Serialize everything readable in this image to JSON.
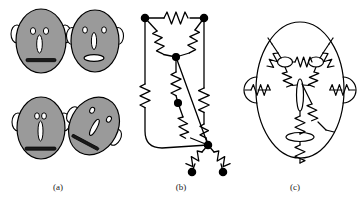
{
  "figure": {
    "type": "scientific-figure",
    "panel_count": 3,
    "background_color": "#ffffff"
  },
  "captions": {
    "a": "(a)",
    "b": "(b)",
    "c": "(c)"
  },
  "colors": {
    "face_fill": "#9a9a9a",
    "stroke": "#000000",
    "feature_fill": "#ffffff",
    "mouth_fill": "#1a1a1a",
    "caption_text": "#1a1a1a"
  },
  "panel_a": {
    "name": "cartoon-faces",
    "description": "Four shaded cartoon faces with eyes, nose, mouth and ears",
    "faces": [
      {
        "id": "face-1",
        "label": "upper-left-face",
        "cx": 41,
        "cy": 41,
        "rx": 25,
        "ry": 32,
        "rotation": 0,
        "eyes": [
          {
            "cx": 33,
            "cy": 31,
            "rx": 2.6,
            "ry": 3.4
          },
          {
            "cx": 46,
            "cy": 31,
            "rx": 2.6,
            "ry": 3.4
          }
        ],
        "nose": {
          "cx": 39.5,
          "cy": 44,
          "rx": 2.8,
          "ry": 9
        },
        "mouth": {
          "x": 26,
          "y": 59,
          "w": 30,
          "h": 3.2,
          "style": "line"
        },
        "ears": [
          {
            "cx": 17,
            "cy": 34,
            "rx": 6,
            "ry": 9,
            "side": "left"
          },
          {
            "cx": 65,
            "cy": 34,
            "rx": 6,
            "ry": 9,
            "side": "right"
          }
        ]
      },
      {
        "id": "face-2",
        "label": "upper-right-face",
        "cx": 95,
        "cy": 41,
        "rx": 24,
        "ry": 31,
        "rotation": 0,
        "eyes": [
          {
            "cx": 85,
            "cy": 30,
            "rx": 2.4,
            "ry": 3.2
          },
          {
            "cx": 104,
            "cy": 30,
            "rx": 2.4,
            "ry": 3.2
          }
        ],
        "nose": {
          "cx": 94,
          "cy": 41,
          "rx": 2.6,
          "ry": 8.5
        },
        "mouth": {
          "cx": 94,
          "cy": 58,
          "rx": 10,
          "ry": 3.4,
          "style": "oval"
        },
        "ears": [
          {
            "cx": 72,
            "cy": 36,
            "rx": 5.5,
            "ry": 8.5,
            "side": "left"
          },
          {
            "cx": 118,
            "cy": 36,
            "rx": 5.5,
            "ry": 8.5,
            "side": "right"
          }
        ]
      },
      {
        "id": "face-3",
        "label": "lower-left-face",
        "cx": 41,
        "cy": 128,
        "rx": 24,
        "ry": 31,
        "rotation": 0,
        "eyes": [
          {
            "cx": 37,
            "cy": 116,
            "rx": 2.4,
            "ry": 3.2
          },
          {
            "cx": 44,
            "cy": 116,
            "rx": 2.4,
            "ry": 3.2
          }
        ],
        "nose": {
          "cx": 40.5,
          "cy": 131,
          "rx": 2.5,
          "ry": 10
        },
        "mouth": {
          "x": 25,
          "y": 147,
          "w": 31,
          "h": 3.2,
          "style": "line"
        },
        "ears": [
          {
            "cx": 18,
            "cy": 122,
            "rx": 6,
            "ry": 9,
            "side": "left"
          },
          {
            "cx": 64,
            "cy": 122,
            "rx": 6,
            "ry": 9,
            "side": "right"
          }
        ]
      },
      {
        "id": "face-4",
        "label": "lower-right-face-rotated",
        "cx": 94,
        "cy": 126,
        "rx": 24,
        "ry": 30,
        "rotation": 30,
        "eyes": [
          {
            "cx": 89,
            "cy": 107,
            "rx": 2.2,
            "ry": 3.0
          },
          {
            "cx": 112,
            "cy": 128,
            "rx": 2.2,
            "ry": 3.0
          }
        ],
        "nose": {
          "cx": 101,
          "cy": 129,
          "rx": 2.6,
          "ry": 9
        },
        "mouth": {
          "x": 78,
          "y": 148,
          "w": 27,
          "h": 3.0,
          "style": "line"
        },
        "ears": [
          {
            "cx": 77,
            "cy": 153,
            "rx": 5.5,
            "ry": 8.5,
            "side": "bottom-left"
          },
          {
            "cx": 115,
            "cy": 152,
            "rx": 5.5,
            "ry": 8.5,
            "side": "bottom-right"
          }
        ]
      }
    ]
  },
  "panel_b": {
    "name": "resistor-network-graph",
    "description": "Abstract graph of nodes joined by zig-zag resistor edges",
    "node_radius": 3.4,
    "nodes": [
      {
        "id": "n1",
        "label": "top-left-node",
        "x": 19,
        "y": 18
      },
      {
        "id": "n2",
        "label": "top-right-node",
        "x": 78,
        "y": 18
      },
      {
        "id": "n3",
        "label": "upper-center-node",
        "x": 50,
        "y": 57
      },
      {
        "id": "n4",
        "label": "mid-center-node",
        "x": 52,
        "y": 103
      },
      {
        "id": "n5",
        "label": "bottom-junction-node",
        "x": 82,
        "y": 145
      },
      {
        "id": "n6",
        "label": "bottom-left-terminal",
        "x": 66,
        "y": 172
      },
      {
        "id": "n7",
        "label": "bottom-right-terminal",
        "x": 97,
        "y": 172
      }
    ],
    "resistor_edges": [
      {
        "from": "n1",
        "to": "n2",
        "label": "top-horizontal-resistor"
      },
      {
        "from": "n1",
        "to": "n3",
        "label": "left-diagonal-resistor"
      },
      {
        "from": "n2",
        "to": "n3",
        "label": "right-diagonal-resistor"
      },
      {
        "from": "n3",
        "to": "n4",
        "label": "center-vertical-resistor"
      },
      {
        "from": "n4",
        "to": "n5",
        "label": "center-lower-resistor"
      },
      {
        "from": "n2",
        "to": "n5",
        "label": "right-vertical-resistor"
      },
      {
        "from": "n1",
        "to": "n5",
        "label": "left-outer-resistor-loop"
      },
      {
        "from": "n5",
        "to": "n6",
        "label": "bottom-left-resistor"
      },
      {
        "from": "n5",
        "to": "n7",
        "label": "bottom-right-resistor"
      }
    ],
    "plain_edges": [
      {
        "from": "n3",
        "to": "n5",
        "label": "plain-wire-center-to-junction"
      }
    ]
  },
  "panel_c": {
    "name": "face-shaped-circuit",
    "description": "Circuit diagram laid out in the shape of a face: ellipse outline, two eye loops, nose loop, mouth loop and two ear loops, all connected by resistors",
    "outline": {
      "cx": 62,
      "cy": 90,
      "rx": 44,
      "ry": 68,
      "label": "face-outline-ellipse"
    },
    "eyes": [
      {
        "cx": 47,
        "cy": 62,
        "rx": 7.5,
        "ry": 5,
        "label": "left-eye-loop"
      },
      {
        "cx": 78,
        "cy": 62,
        "rx": 7.5,
        "ry": 5,
        "label": "right-eye-loop"
      }
    ],
    "nose": {
      "cx": 62,
      "cy": 95,
      "rx": 3.5,
      "ry": 16,
      "label": "nose-loop"
    },
    "mouth": {
      "cx": 62,
      "cy": 137,
      "rx": 14,
      "ry": 4.5,
      "label": "mouth-loop"
    },
    "ears": [
      {
        "cx": 14,
        "cy": 90,
        "r": 12,
        "side": "left",
        "label": "left-ear-loop"
      },
      {
        "cx": 110,
        "cy": 90,
        "r": 12,
        "side": "right",
        "label": "right-ear-loop"
      }
    ],
    "resistors": [
      {
        "label": "eye-bridge-resistor",
        "orientation": "horizontal",
        "between": [
          "left-eye-loop",
          "right-eye-loop"
        ]
      },
      {
        "label": "left-eye-to-brow-resistor",
        "orientation": "diagonal",
        "between": [
          "left-eye-loop",
          "face-outline-ellipse"
        ]
      },
      {
        "label": "right-eye-to-brow-resistor",
        "orientation": "diagonal",
        "between": [
          "right-eye-loop",
          "face-outline-ellipse"
        ]
      },
      {
        "label": "left-eye-to-nose-resistor",
        "orientation": "diagonal",
        "between": [
          "left-eye-loop",
          "nose-loop"
        ]
      },
      {
        "label": "right-eye-to-nose-resistor",
        "orientation": "diagonal",
        "between": [
          "right-eye-loop",
          "nose-loop"
        ]
      },
      {
        "label": "nose-to-mouth-resistor",
        "orientation": "vertical",
        "between": [
          "nose-loop",
          "mouth-loop"
        ]
      },
      {
        "label": "cheek-resistor",
        "orientation": "diagonal",
        "between": [
          "nose-loop",
          "face-outline-ellipse"
        ]
      },
      {
        "label": "mouth-to-chin-resistor",
        "orientation": "vertical",
        "between": [
          "mouth-loop",
          "face-outline-ellipse"
        ]
      },
      {
        "label": "left-ear-resistor",
        "orientation": "horizontal",
        "between": [
          "left-ear-loop",
          "face-outline-ellipse"
        ]
      },
      {
        "label": "right-ear-resistor",
        "orientation": "horizontal",
        "between": [
          "right-ear-loop",
          "face-outline-ellipse"
        ]
      }
    ]
  }
}
